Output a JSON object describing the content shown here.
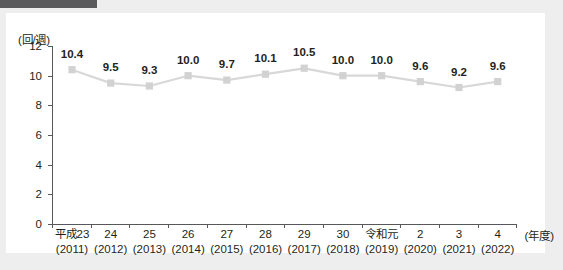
{
  "page": {
    "background_color": "#eeeeee",
    "card_background": "#ffffff",
    "accent_bar_color": "#5a5a5d"
  },
  "chart_data": {
    "type": "line",
    "title": "",
    "subtitle": "",
    "unit_label": "(回/週)",
    "xlabel": "(年度)",
    "ylabel": "",
    "ylim": [
      0,
      12
    ],
    "y_ticks": [
      "0",
      "2",
      "4",
      "6",
      "8",
      "10",
      "12"
    ],
    "grid": false,
    "legend": "none",
    "marker_color": "#d2d2d2",
    "line_color": "#d8d8d8",
    "label_color": "#231f20",
    "axis_color": "#58585b",
    "categories": [
      "平成23",
      "24",
      "25",
      "26",
      "27",
      "28",
      "29",
      "30",
      "令和元",
      "2",
      "3",
      "4"
    ],
    "categories_western": [
      "(2011)",
      "(2012)",
      "(2013)",
      "(2014)",
      "(2015)",
      "(2016)",
      "(2017)",
      "(2018)",
      "(2019)",
      "(2020)",
      "(2021)",
      "(2022)"
    ],
    "values": [
      10.4,
      9.5,
      9.3,
      10.0,
      9.7,
      10.1,
      10.5,
      10.0,
      10.0,
      9.6,
      9.2,
      9.6
    ],
    "value_labels": [
      "10.4",
      "9.5",
      "9.3",
      "10.0",
      "9.7",
      "10.1",
      "10.5",
      "10.0",
      "10.0",
      "9.6",
      "9.2",
      "9.6"
    ]
  }
}
